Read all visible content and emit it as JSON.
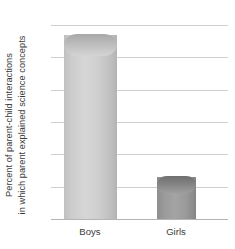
{
  "chart_data": {
    "type": "bar",
    "title": "",
    "subtitle": "",
    "xlabel": "",
    "ylabel_line_1": "Percent of parent-child interactions",
    "ylabel_line_2": "in which parent explained science concepts",
    "categories": [
      "Boys",
      "Girls"
    ],
    "values": [
      28.5,
      6.5
    ],
    "series": [
      {
        "name": "Percent of parent-child interactions in which parent explained science concepts",
        "values": [
          28.5,
          6.5
        ]
      }
    ],
    "ylim": [
      0,
      30
    ],
    "ytick_labels": [
      "30",
      "25",
      "20",
      "15",
      "10",
      "5",
      "0"
    ],
    "ytick_values": [
      30,
      25,
      20,
      15,
      10,
      5,
      0
    ],
    "grid": true,
    "legend": "none",
    "annotations": [],
    "colors": {
      "bar_boys": "#d4d4d4",
      "bar_girls": "#9a9a9a",
      "gridline": "#cfcfcf",
      "axis": "#b4b4b4",
      "text": "#3c3c3c",
      "background": "#ffffff"
    }
  }
}
